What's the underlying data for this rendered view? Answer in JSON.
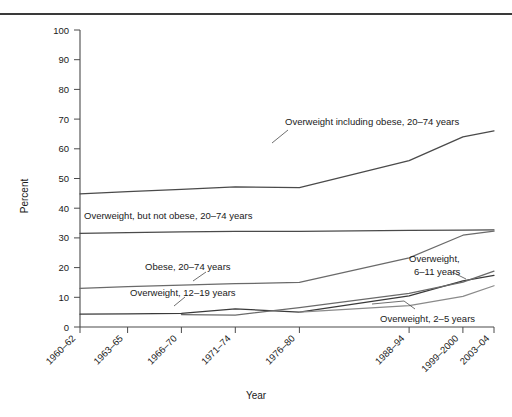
{
  "figure": {
    "background": "#ffffff",
    "rule_color": "#3a3a3a"
  },
  "chart_data": {
    "type": "line",
    "title": "",
    "xlabel": "Year",
    "ylabel": "Percent",
    "ylim": [
      0,
      100
    ],
    "ytick_step": 10,
    "grid": false,
    "legend_position": "inline-annotations",
    "categories": [
      "1960–62",
      "1963–65",
      "1966–70",
      "1971–74",
      "1976–80",
      "1988–94",
      "1999–2000",
      "2003–04"
    ],
    "x_positions": [
      0.0,
      0.115,
      0.245,
      0.375,
      0.53,
      0.795,
      0.925,
      1.0
    ],
    "series": [
      {
        "name": "Overweight including obese, 20–74 years",
        "color": "#4a4a4a",
        "x": [
          0.0,
          0.115,
          0.245,
          0.375,
          0.53,
          0.795,
          0.925,
          1.0
        ],
        "values": [
          44.8,
          45.6,
          46.3,
          47.2,
          46.9,
          56.0,
          64.0,
          66.0
        ]
      },
      {
        "name": "Overweight, but not obese, 20–74 years",
        "color": "#4a4a4a",
        "x": [
          0.0,
          0.115,
          0.245,
          0.375,
          0.53,
          0.795,
          0.925,
          1.0
        ],
        "values": [
          31.5,
          31.8,
          32.0,
          32.2,
          32.2,
          32.5,
          32.6,
          32.7
        ]
      },
      {
        "name": "Obese, 20–74 years",
        "color": "#6a6a6a",
        "x": [
          0.0,
          0.115,
          0.245,
          0.375,
          0.53,
          0.795,
          0.925,
          1.0
        ],
        "values": [
          13.0,
          13.6,
          14.1,
          14.6,
          15.0,
          23.3,
          30.9,
          32.3
        ]
      },
      {
        "name": "Overweight, 12–19 years",
        "color": "#3a3a3a",
        "x": [
          0.0,
          0.115,
          0.245,
          0.375,
          0.53,
          0.795,
          0.925,
          1.0
        ],
        "values": [
          4.3,
          4.4,
          4.6,
          6.1,
          5.0,
          10.5,
          15.5,
          17.4
        ]
      },
      {
        "name": "Overweight, 6–11 years",
        "color": "#6a6a6a",
        "x": [
          0.245,
          0.375,
          0.53,
          0.795,
          0.925,
          1.0
        ],
        "values": [
          4.2,
          4.0,
          6.5,
          11.3,
          15.1,
          18.8
        ]
      },
      {
        "name": "Overweight, 2–5 years",
        "color": "#8a8a8a",
        "x": [
          0.53,
          0.795,
          0.925,
          1.0
        ],
        "values": [
          5.0,
          7.2,
          10.3,
          13.9
        ]
      }
    ],
    "annotations": [
      {
        "id": "label-overweight-including-obese",
        "text": "Overweight including obese, 20–74 years"
      },
      {
        "id": "label-overweight-not-obese",
        "text": "Overweight, but not obese, 20–74 years"
      },
      {
        "id": "label-obese-20-74",
        "text": "Obese, 20–74 years"
      },
      {
        "id": "label-overweight-12-19",
        "text": "Overweight, 12–19 years"
      },
      {
        "id": "label-overweight-6-11-line1",
        "text": "Overweight,"
      },
      {
        "id": "label-overweight-6-11-line2",
        "text": "6–11 years"
      },
      {
        "id": "label-overweight-2-5",
        "text": "Overweight, 2–5 years"
      }
    ],
    "ytick_labels": [
      "0",
      "10",
      "20",
      "30",
      "40",
      "50",
      "60",
      "70",
      "80",
      "90",
      "100"
    ]
  }
}
